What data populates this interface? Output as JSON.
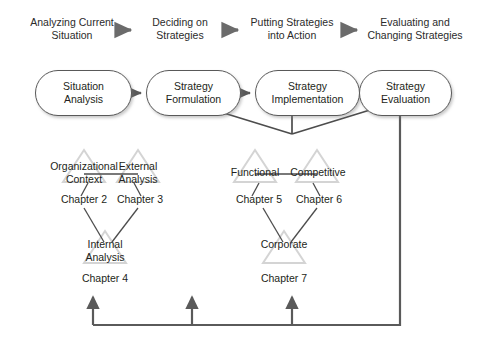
{
  "diagram": {
    "colors": {
      "pill_border": "#595959",
      "pill_fill": "#ffffff",
      "triangle_outline": "#d4d4d4",
      "connector": "#4d4d4d",
      "feedback_line": "#5a5a5a",
      "text": "#231f20",
      "background": "#ffffff"
    }
  },
  "phases": [
    {
      "id": "phase-analyzing",
      "label": "Analyzing Current\nSituation"
    },
    {
      "id": "phase-deciding",
      "label": "Deciding on\nStrategies"
    },
    {
      "id": "phase-putting",
      "label": "Putting Strategies\ninto Action"
    },
    {
      "id": "phase-evaluating",
      "label": "Evaluating and\nChanging Strategies"
    }
  ],
  "phase_arrows": [
    {
      "id": "phase-arrow-1"
    },
    {
      "id": "phase-arrow-2"
    },
    {
      "id": "phase-arrow-3"
    }
  ],
  "stages": [
    {
      "id": "stage-situation-analysis",
      "label": "Situation\nAnalysis"
    },
    {
      "id": "stage-strategy-formulation",
      "label": "Strategy\nFormulation"
    },
    {
      "id": "stage-strategy-implementation",
      "label": "Strategy\nImplementation"
    },
    {
      "id": "stage-strategy-evaluation",
      "label": "Strategy\nEvaluation"
    }
  ],
  "stage_arrows": [
    {
      "id": "stage-arrow-1"
    },
    {
      "id": "stage-arrow-2"
    },
    {
      "id": "stage-arrow-3"
    }
  ],
  "clusters": [
    {
      "id": "cluster-situation-analysis",
      "top_left": {
        "label": "Organizational\nContext",
        "chapter": "Chapter 2"
      },
      "top_right": {
        "label": "External\nAnalysis",
        "chapter": "Chapter 3"
      },
      "bottom": {
        "label": "Internal\nAnalysis",
        "chapter": "Chapter 4"
      }
    },
    {
      "id": "cluster-strategy-formulation",
      "top_left": {
        "label": "Functional",
        "chapter": "Chapter 5"
      },
      "top_right": {
        "label": "Competitive",
        "chapter": "Chapter 6"
      },
      "bottom": {
        "label": "Corporate",
        "chapter": "Chapter 7"
      }
    }
  ],
  "feedback": {
    "id": "feedback-loop",
    "description": "Feedback from Strategy Evaluation back to earlier stages",
    "arrow_count": 3
  }
}
